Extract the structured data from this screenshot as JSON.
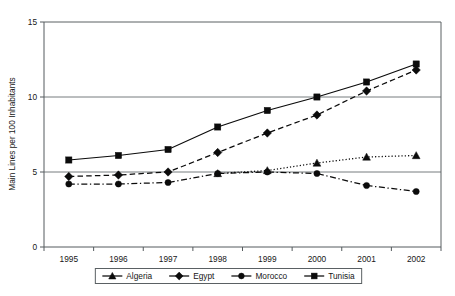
{
  "chart_data": {
    "type": "line",
    "title": "",
    "xlabel": "",
    "ylabel": "Main Lines per 100 Inhabitants",
    "categories": [
      "1995",
      "1996",
      "1997",
      "1998",
      "1999",
      "2000",
      "2001",
      "2002"
    ],
    "ylim": [
      0,
      15
    ],
    "yticks": [
      0,
      5,
      10,
      15
    ],
    "ytick_labels": [
      "0",
      "5",
      "10",
      "15"
    ],
    "grid": "horizontal",
    "legend_position": "bottom",
    "series": [
      {
        "name": "Algeria",
        "marker": "triangle",
        "line_style": "dotted",
        "values": [
          null,
          null,
          null,
          4.9,
          5.1,
          5.6,
          6.0,
          6.1
        ]
      },
      {
        "name": "Egypt",
        "marker": "diamond",
        "line_style": "dashed",
        "values": [
          4.7,
          4.8,
          5.0,
          6.3,
          7.6,
          8.8,
          10.4,
          11.8
        ]
      },
      {
        "name": "Morocco",
        "marker": "circle",
        "line_style": "dash-dot",
        "values": [
          4.2,
          4.2,
          4.3,
          4.9,
          5.0,
          4.9,
          4.1,
          3.7
        ]
      },
      {
        "name": "Tunisia",
        "marker": "square",
        "line_style": "solid",
        "values": [
          5.8,
          6.1,
          6.5,
          8.0,
          9.1,
          10.0,
          11.0,
          12.2
        ]
      }
    ],
    "colors": {
      "series_ink": "#0b0b0b",
      "grid": "#767c7f",
      "axis": "#555b5e",
      "background": "#ffffff"
    }
  }
}
